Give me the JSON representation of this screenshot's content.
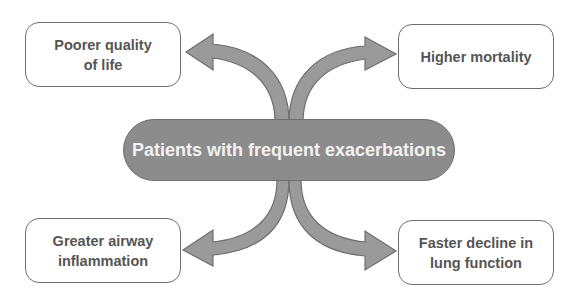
{
  "center": {
    "label": "Patients with frequent exacerbations"
  },
  "outcomes": {
    "top_left": {
      "label": "Poorer quality of life"
    },
    "top_right": {
      "label": "Higher mortality"
    },
    "bottom_left": {
      "label": "Greater airway inflammation"
    },
    "bottom_right": {
      "label": "Faster decline in lung function"
    }
  },
  "colors": {
    "arrow_fill": "#9a9a9a",
    "arrow_stroke": "#6e6e6e",
    "center_fill": "#8c8c8c",
    "box_border": "#6e6e6e",
    "box_text": "#555555",
    "center_text": "#f2f2f2"
  }
}
